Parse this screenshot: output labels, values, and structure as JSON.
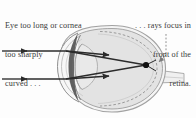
{
  "figure": {
    "width": 196,
    "height": 118,
    "background": "#fdfdfd"
  },
  "captions": {
    "left": {
      "name": "cause-caption",
      "lines": [
        "Eye too long or cornea",
        "too sharply",
        "curved . . ."
      ]
    },
    "right": {
      "name": "effect-caption",
      "lines": [
        ". . . rays focus in",
        "front of the",
        "retina."
      ]
    }
  },
  "labels": {
    "retina_leader": "retina-leader-line"
  },
  "colors": {
    "text": "#3a3a3a",
    "ray": "#2b2b2b",
    "eye_fill": "#e2e2e2",
    "eye_stroke": "#8d8d8d",
    "sclera_fill": "#f2f2f2",
    "lens_fill": "#e8e8e8",
    "iris_dark": "#4a4a4a",
    "retina_dash": "#9a9a9a",
    "focal_point": "#111111",
    "nerve_fill": "#f0f0f0"
  },
  "anatomy": [
    {
      "name": "eyeball-sclera",
      "label": "Eyeball (sclera)"
    },
    {
      "name": "cornea",
      "label": "Cornea"
    },
    {
      "name": "lens",
      "label": "Lens"
    },
    {
      "name": "iris-crescent",
      "label": "Iris / ciliary body"
    },
    {
      "name": "retina-arc",
      "label": "Retina"
    },
    {
      "name": "optic-nerve",
      "label": "Optic nerve"
    },
    {
      "name": "vitreous-body",
      "label": "Vitreous body"
    }
  ],
  "optics": {
    "incoming_rays": [
      {
        "name": "incoming-ray-upper",
        "y": 51
      },
      {
        "name": "incoming-ray-lower",
        "y": 79
      }
    ],
    "refracted_rays": [
      {
        "name": "refracted-ray-upper"
      },
      {
        "name": "refracted-ray-lower"
      }
    ],
    "focal_point": {
      "name": "focal-point",
      "x": 146,
      "y": 65
    }
  }
}
